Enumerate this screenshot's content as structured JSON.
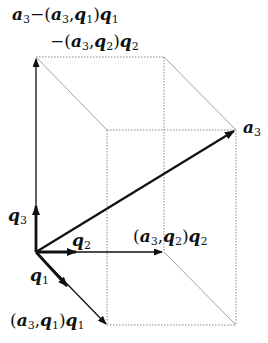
{
  "diagram": {
    "type": "gram-schmidt-3d-projection",
    "colors": {
      "stroke": "#111111",
      "dotted": "#888888",
      "background": "#ffffff"
    },
    "labels": {
      "top_line1": {
        "vec": "a",
        "sub": "3",
        "minus": "−",
        "open": "(",
        "a": "a",
        "a_sub": "3",
        "comma": ",",
        "q": "q",
        "q_sub": "1",
        "close": ")",
        "q2": "q",
        "q2_sub": "1"
      },
      "top_line2": {
        "minus": "−",
        "open": "(",
        "a": "a",
        "a_sub": "3",
        "comma": ",",
        "q": "q",
        "q_sub": "2",
        "close": ")",
        "q2": "q",
        "q2_sub": "2"
      },
      "a3": {
        "vec": "a",
        "sub": "3"
      },
      "q3": {
        "vec": "q",
        "sub": "3"
      },
      "q2": {
        "vec": "q",
        "sub": "2"
      },
      "q1": {
        "vec": "q",
        "sub": "1"
      },
      "proj_q2": {
        "open": "(",
        "a": "a",
        "a_sub": "3",
        "comma": ",",
        "q": "q",
        "q_sub": "2",
        "close": ")",
        "q2": "q",
        "q2_sub": "2"
      },
      "proj_q1": {
        "open": "(",
        "a": "a",
        "a_sub": "3",
        "comma": ",",
        "q": "q",
        "q_sub": "1",
        "close": ")",
        "q2": "q",
        "q2_sub": "1"
      }
    },
    "points": {
      "origin": [
        36,
        252
      ],
      "q3_tip": [
        36,
        206
      ],
      "q2_tip": [
        74,
        252
      ],
      "q1_tip": [
        65,
        284
      ],
      "residual_tip": [
        36,
        57
      ],
      "proj_q2_tip": [
        164,
        252
      ],
      "proj_q1_tip": [
        107,
        325
      ],
      "a3_tip": [
        236,
        130
      ],
      "back_top_right": [
        164,
        57
      ],
      "front_top_left": [
        107,
        130
      ],
      "front_bottom_right": [
        236,
        325
      ]
    }
  }
}
